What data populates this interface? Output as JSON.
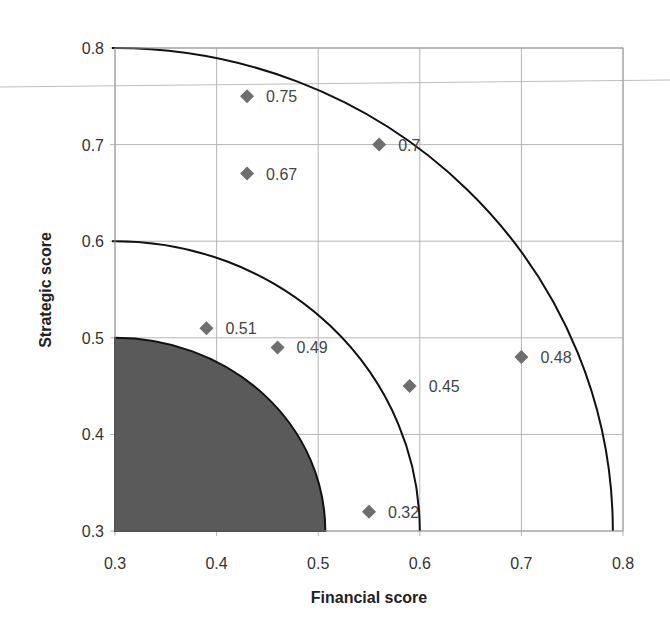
{
  "chart_data": {
    "type": "scatter",
    "title": "",
    "xlabel": "Financial score",
    "ylabel": "Strategic score",
    "xlim": [
      0.3,
      0.8
    ],
    "ylim": [
      0.3,
      0.8
    ],
    "grid": true,
    "legend": null,
    "x_ticks": [
      "0.3",
      "0.4",
      "0.5",
      "0.6",
      "0.7",
      "0.8"
    ],
    "y_ticks": [
      "0.3",
      "0.4",
      "0.5",
      "0.6",
      "0.7",
      "0.8"
    ],
    "series": [
      {
        "name": "Projects",
        "marker": "diamond",
        "color": "#6e6e6e",
        "points": [
          {
            "x": 0.43,
            "y": 0.75,
            "label": "0.75"
          },
          {
            "x": 0.56,
            "y": 0.7,
            "label": "0.7"
          },
          {
            "x": 0.43,
            "y": 0.67,
            "label": "0.67"
          },
          {
            "x": 0.39,
            "y": 0.51,
            "label": "0.51"
          },
          {
            "x": 0.46,
            "y": 0.49,
            "label": "0.49"
          },
          {
            "x": 0.59,
            "y": 0.45,
            "label": "0.45"
          },
          {
            "x": 0.7,
            "y": 0.48,
            "label": "0.48"
          },
          {
            "x": 0.55,
            "y": 0.32,
            "label": "0.32"
          }
        ]
      }
    ],
    "annotations": [
      {
        "type": "quarter-ellipse-filled",
        "center": [
          0.3,
          0.3
        ],
        "rx": 0.207,
        "ry": 0.2,
        "fill": "#5a5a5a"
      },
      {
        "type": "quarter-ellipse-arc",
        "center": [
          0.3,
          0.3
        ],
        "rx": 0.3,
        "ry": 0.3,
        "stroke": "#111111"
      },
      {
        "type": "quarter-ellipse-arc",
        "center": [
          0.3,
          0.3
        ],
        "rx": 0.49,
        "ry": 0.5,
        "stroke": "#111111"
      }
    ]
  }
}
